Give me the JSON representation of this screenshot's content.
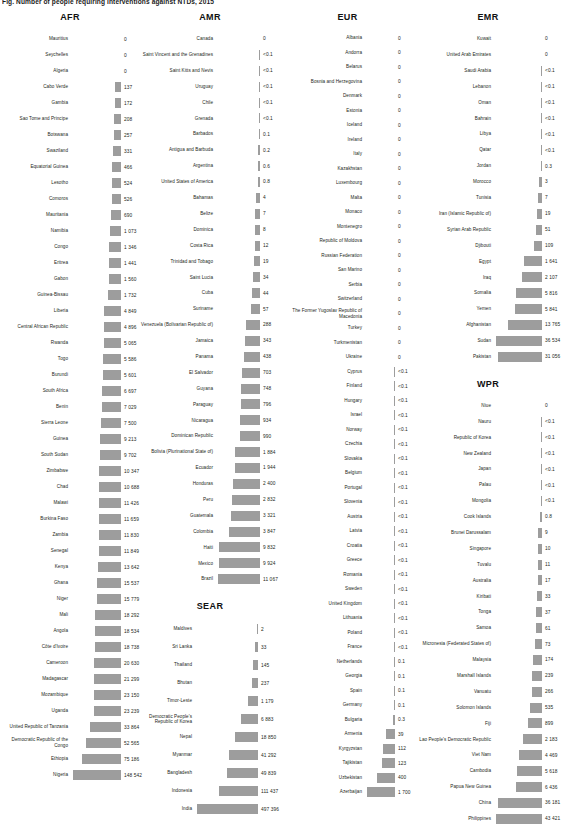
{
  "figure": {
    "title": "Fig. Number of people requiring interventions against NTDs, 2015",
    "bar_color": "#9d9d9d",
    "text_color": "#231f20"
  },
  "chart_data": {
    "type": "bar",
    "title": "Fig. Number of people requiring interventions against NTDs, 2015",
    "xlabel": "",
    "ylabel": "",
    "orientation": "horizontal",
    "grid": false,
    "legend": null,
    "note": "Values shown in thousands; bars are sorted ascending within each WHO region panel.",
    "panels": [
      {
        "name": "AFR",
        "categories": [
          "Mauritius",
          "Seychelles",
          "Algeria",
          "Cabo Verde",
          "Gambia",
          "Sao Tome and Principe",
          "Botswana",
          "Swaziland",
          "Equatorial Guinea",
          "Lesotho",
          "Comoros",
          "Mauritania",
          "Namibia",
          "Congo",
          "Eritrea",
          "Gabon",
          "Guinea-Bissau",
          "Liberia",
          "Central African Republic",
          "Rwanda",
          "Togo",
          "Burundi",
          "South Africa",
          "Benin",
          "Sierra Leone",
          "Guinea",
          "South Sudan",
          "Zimbabwe",
          "Chad",
          "Malawi",
          "Burkina Faso",
          "Zambia",
          "Senegal",
          "Kenya",
          "Ghana",
          "Niger",
          "Mali",
          "Angola",
          "Côte d'Ivoire",
          "Cameroon",
          "Madagascar",
          "Mozambique",
          "Uganda",
          "United Republic of Tanzania",
          "Democratic Republic of the Congo",
          "Ethiopia",
          "Nigeria"
        ],
        "labels": [
          "0",
          "0",
          "0",
          "137",
          "172",
          "208",
          "257",
          "331",
          "466",
          "524",
          "526",
          "690",
          "1 073",
          "1 346",
          "1 441",
          "1 560",
          "1 732",
          "4 849",
          "4 896",
          "5 065",
          "5 586",
          "5 601",
          "6 697",
          "7 029",
          "7 500",
          "9 213",
          "9 702",
          "10 347",
          "10 688",
          "11 426",
          "11 659",
          "11 830",
          "11 849",
          "13 642",
          "15 537",
          "15 779",
          "18 292",
          "18 534",
          "18 738",
          "20 630",
          "21 299",
          "23 150",
          "23 239",
          "33 864",
          "52 565",
          "75 186",
          "148 542"
        ],
        "values": [
          0,
          0,
          0,
          137,
          172,
          208,
          257,
          331,
          466,
          524,
          526,
          690,
          1073,
          1346,
          1441,
          1560,
          1732,
          4849,
          4896,
          5065,
          5586,
          5601,
          6697,
          7029,
          7500,
          9213,
          9702,
          10347,
          10688,
          11426,
          11659,
          11830,
          11849,
          13642,
          15537,
          15779,
          18292,
          18534,
          18738,
          20630,
          21299,
          23150,
          23239,
          33864,
          52565,
          75186,
          148542
        ]
      },
      {
        "name": "AMR",
        "categories": [
          "Canada",
          "Saint Vincent and the Grenadines",
          "Saint Kitts and Nevis",
          "Uruguay",
          "Chile",
          "Grenada",
          "Barbados",
          "Antigua and Barbuda",
          "Argentina",
          "United States of America",
          "Bahamas",
          "Belize",
          "Dominica",
          "Costa Rica",
          "Trinidad and Tobago",
          "Saint Lucia",
          "Cuba",
          "Suriname",
          "Venezuela (Bolivarian Republic of)",
          "Jamaica",
          "Panama",
          "El Salvador",
          "Guyana",
          "Paraguay",
          "Nicaragua",
          "Dominican Republic",
          "Bolivia (Plurinational State of)",
          "Ecuador",
          "Honduras",
          "Peru",
          "Guatemala",
          "Colombia",
          "Haiti",
          "Mexico",
          "Brazil"
        ],
        "labels": [
          "0",
          "<0.1",
          "<0.1",
          "<0.1",
          "<0.1",
          "<0.1",
          "0.1",
          "0.2",
          "0.6",
          "0.8",
          "4",
          "7",
          "8",
          "12",
          "19",
          "34",
          "44",
          "57",
          "288",
          "343",
          "438",
          "703",
          "748",
          "796",
          "934",
          "990",
          "1 884",
          "1 944",
          "2 400",
          "2 832",
          "3 321",
          "3 847",
          "9 832",
          "9 924",
          "11 067"
        ],
        "values": [
          0,
          0.05,
          0.05,
          0.05,
          0.05,
          0.05,
          0.1,
          0.2,
          0.6,
          0.8,
          4,
          7,
          8,
          12,
          19,
          34,
          44,
          57,
          288,
          343,
          438,
          703,
          748,
          796,
          934,
          990,
          1884,
          1944,
          2400,
          2832,
          3321,
          3847,
          9832,
          9924,
          11067
        ]
      },
      {
        "name": "SEAR",
        "categories": [
          "Maldives",
          "Sri Lanka",
          "Thailand",
          "Bhutan",
          "Timor-Leste",
          "Democratic People's Republic of Korea",
          "Nepal",
          "Myanmar",
          "Bangladesh",
          "Indonesia",
          "India"
        ],
        "labels": [
          "2",
          "33",
          "145",
          "237",
          "1 179",
          "6 883",
          "18 850",
          "41 292",
          "49 839",
          "111 437",
          "497 396"
        ],
        "values": [
          2,
          33,
          145,
          237,
          1179,
          6883,
          18850,
          41292,
          49839,
          111437,
          497396
        ]
      },
      {
        "name": "EUR",
        "categories": [
          "Albania",
          "Andorra",
          "Belarus",
          "Bosnia and Herzegovina",
          "Denmark",
          "Estonia",
          "Iceland",
          "Ireland",
          "Italy",
          "Kazakhstan",
          "Luxembourg",
          "Malta",
          "Monaco",
          "Montenegro",
          "Republic of Moldova",
          "Russian Federation",
          "San Marino",
          "Serbia",
          "Switzerland",
          "The Former Yugoslav Republic of Macedonia",
          "Turkey",
          "Turkmenistan",
          "Ukraine",
          "Cyprus",
          "Finland",
          "Hungary",
          "Israel",
          "Norway",
          "Czechia",
          "Slovakia",
          "Belgium",
          "Portugal",
          "Slovenia",
          "Austria",
          "Latvia",
          "Croatia",
          "Greece",
          "Romania",
          "Sweden",
          "United Kingdom",
          "Lithuania",
          "Poland",
          "France",
          "Netherlands",
          "Georgia",
          "Spain",
          "Germany",
          "Bulgaria",
          "Armenia",
          "Kyrgyzstan",
          "Tajikistan",
          "Uzbekistan",
          "Azerbaijan"
        ],
        "labels": [
          "0",
          "0",
          "0",
          "0",
          "0",
          "0",
          "0",
          "0",
          "0",
          "0",
          "0",
          "0",
          "0",
          "0",
          "0",
          "0",
          "0",
          "0",
          "0",
          "0",
          "0",
          "0",
          "0",
          "<0.1",
          "<0.1",
          "<0.1",
          "<0.1",
          "<0.1",
          "<0.1",
          "<0.1",
          "<0.1",
          "<0.1",
          "<0.1",
          "<0.1",
          "<0.1",
          "<0.1",
          "<0.1",
          "<0.1",
          "<0.1",
          "<0.1",
          "<0.1",
          "<0.1",
          "<0.1",
          "0.1",
          "0.1",
          "0.1",
          "0.1",
          "0.3",
          "39",
          "112",
          "123",
          "400",
          "1 700"
        ],
        "values": [
          0,
          0,
          0,
          0,
          0,
          0,
          0,
          0,
          0,
          0,
          0,
          0,
          0,
          0,
          0,
          0,
          0,
          0,
          0,
          0,
          0,
          0,
          0,
          0.02,
          0.02,
          0.02,
          0.02,
          0.03,
          0.03,
          0.03,
          0.04,
          0.04,
          0.04,
          0.04,
          0.05,
          0.05,
          0.05,
          0.05,
          0.06,
          0.06,
          0.06,
          0.06,
          0.06,
          0.1,
          0.1,
          0.1,
          0.1,
          0.3,
          39,
          112,
          123,
          400,
          1700
        ]
      },
      {
        "name": "EMR",
        "categories": [
          "Kuwait",
          "United Arab Emirates",
          "Saudi Arabia",
          "Lebanon",
          "Oman",
          "Bahrain",
          "Libya",
          "Qatar",
          "Jordan",
          "Morocco",
          "Tunisia",
          "Iran (Islamic Republic of)",
          "Syrian Arab Republic",
          "Djibouti",
          "Egypt",
          "Iraq",
          "Somalia",
          "Yemen",
          "Afghanistan",
          "Sudan",
          "Pakistan"
        ],
        "labels": [
          "0",
          "0",
          "<0.1",
          "<0.1",
          "<0.1",
          "<0.1",
          "<0.1",
          "<0.1",
          "0.3",
          "3",
          "7",
          "19",
          "51",
          "109",
          "1 641",
          "2 107",
          "5 816",
          "5 841",
          "13 765",
          "36 534",
          "31 056"
        ],
        "values": [
          0,
          0,
          0.02,
          0.02,
          0.03,
          0.03,
          0.04,
          0.05,
          0.3,
          3,
          7,
          19,
          51,
          109,
          1641,
          2107,
          5816,
          5841,
          13765,
          36534,
          31056
        ]
      },
      {
        "name": "WPR",
        "categories": [
          "Niue",
          "Nauru",
          "Republic of Korea",
          "New Zealand",
          "Japan",
          "Palau",
          "Mongolia",
          "Cook Islands",
          "Brunei Darussalam",
          "Singapore",
          "Tuvalu",
          "Australia",
          "Kiribati",
          "Tonga",
          "Samoa",
          "Micronesia (Federated States of)",
          "Malaysia",
          "Marshall Islands",
          "Vanuatu",
          "Solomon Islands",
          "Fiji",
          "Lao People's Democratic Republic",
          "Viet Nam",
          "Cambodia",
          "Papua New Guinea",
          "China",
          "Philippines"
        ],
        "labels": [
          "0",
          "<0.1",
          "<0.1",
          "<0.1",
          "<0.1",
          "<0.1",
          "<0.1",
          "0.8",
          "9",
          "10",
          "11",
          "17",
          "33",
          "37",
          "61",
          "73",
          "174",
          "239",
          "266",
          "535",
          "899",
          "2 183",
          "4 469",
          "5 618",
          "6 436",
          "36 181",
          "43 421"
        ],
        "values": [
          0,
          0.02,
          0.02,
          0.03,
          0.04,
          0.05,
          0.06,
          0.8,
          9,
          10,
          11,
          17,
          33,
          37,
          61,
          73,
          174,
          239,
          266,
          535,
          899,
          2183,
          4469,
          5618,
          6436,
          36181,
          43421
        ]
      }
    ]
  }
}
